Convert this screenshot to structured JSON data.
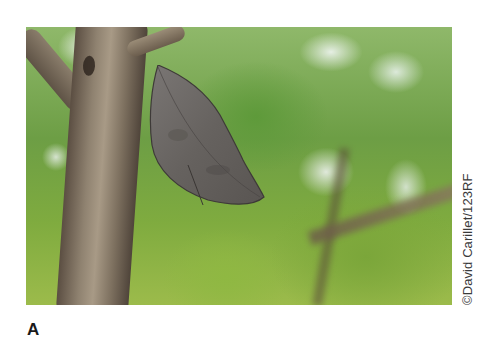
{
  "figure": {
    "panel_label": "A",
    "photo_credit": "©David Carillet/123RF",
    "photo_subject": "dead leaf butterfly on tree branch",
    "colors": {
      "foliage_green": "#6d9e45",
      "bark_brown": "#8f8270",
      "wing_gray": "#6e6a68",
      "credit_text": "#3a3a3a"
    }
  }
}
